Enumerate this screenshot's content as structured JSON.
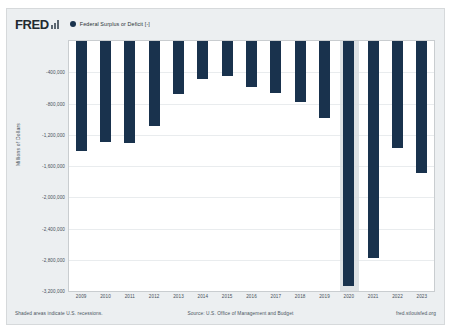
{
  "brand": {
    "logo_text": "FRED",
    "logo_icon": "bar-chart-icon"
  },
  "legend": {
    "marker_icon": "legend-dot-icon",
    "label": "Federal Surplus or Deficit [-]",
    "color": "#19324d"
  },
  "footer": {
    "left": "Shaded areas indicate U.S. recessions.",
    "source": "Source: U.S. Office of Management and Budget",
    "right": "fred.stlouisfed.org"
  },
  "axis": {
    "y_title": "Millions of Dollars",
    "y_ticks": [
      "-400,000",
      "-800,000",
      "-1,200,000",
      "-1,600,000",
      "-2,000,000",
      "-2,400,000",
      "-2,800,000",
      "-3,200,000"
    ],
    "x_ticks": [
      "2009",
      "2010",
      "2011",
      "2012",
      "2013",
      "2014",
      "2015",
      "2016",
      "2017",
      "2018",
      "2019",
      "2020",
      "2021",
      "2022",
      "2023"
    ]
  },
  "recession_bands": [
    {
      "start": "2020",
      "end": "2020",
      "color": "#d8dde1"
    }
  ],
  "chart_data": {
    "type": "bar",
    "title": "Federal Surplus or Deficit [-]",
    "xlabel": "",
    "ylabel": "Millions of Dollars",
    "categories": [
      "2009",
      "2010",
      "2011",
      "2012",
      "2013",
      "2014",
      "2015",
      "2016",
      "2017",
      "2018",
      "2019",
      "2020",
      "2021",
      "2022",
      "2023"
    ],
    "values": [
      -1412688,
      -1294373,
      -1299593,
      -1086958,
      -679501,
      -484793,
      -441960,
      -584651,
      -665446,
      -779138,
      -984155,
      -3131917,
      -2775338,
      -1375391,
      -1695239
    ],
    "series": [
      {
        "name": "Federal Surplus or Deficit [-]",
        "color": "#19324d",
        "values": [
          -1412688,
          -1294373,
          -1299593,
          -1086958,
          -679501,
          -484793,
          -441960,
          -584651,
          -665446,
          -779138,
          -984155,
          -3131917,
          -2775338,
          -1375391,
          -1695239
        ]
      }
    ],
    "ylim": [
      -3200000,
      0
    ],
    "xlim": [
      "2009",
      "2023"
    ],
    "grid": true,
    "legend_position": "top-left",
    "bar_color": "#19324d"
  }
}
